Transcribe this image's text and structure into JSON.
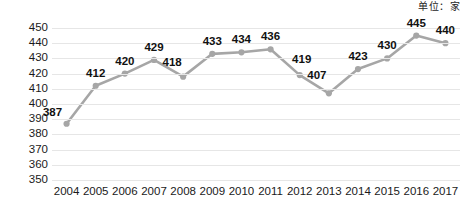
{
  "annotation": {
    "unit_note": "单位：家"
  },
  "chart_data": {
    "type": "line",
    "title": "",
    "subtitle": "",
    "xlabel": "",
    "ylabel": "",
    "unit": "单位：家",
    "categories": [
      "2004",
      "2005",
      "2006",
      "2007",
      "2008",
      "2009",
      "2010",
      "2011",
      "2012",
      "2013",
      "2014",
      "2015",
      "2016",
      "2017"
    ],
    "values": [
      387,
      412,
      420,
      429,
      418,
      433,
      434,
      436,
      419,
      407,
      423,
      430,
      445,
      440
    ],
    "series": [
      {
        "name": "",
        "values": [
          387,
          412,
          420,
          429,
          418,
          433,
          434,
          436,
          419,
          407,
          423,
          430,
          445,
          440
        ]
      }
    ],
    "data_labels": [
      "387",
      "412",
      "420",
      "429",
      "418",
      "433",
      "434",
      "436",
      "419",
      "407",
      "423",
      "430",
      "445",
      "440"
    ],
    "ylim": [
      350,
      450
    ],
    "ytick_step": 10,
    "yticks": [
      "450",
      "440",
      "430",
      "420",
      "410",
      "400",
      "390",
      "380",
      "370",
      "360",
      "350"
    ],
    "xticks": [
      "2004",
      "2005",
      "2006",
      "2007",
      "2008",
      "2009",
      "2010",
      "2011",
      "2012",
      "2013",
      "2014",
      "2015",
      "2016",
      "2017"
    ],
    "grid": true,
    "grid_axis": "y",
    "legend": false,
    "legend_position": "none",
    "marker": "circle",
    "colors": {
      "line": "#a6a6a6",
      "marker": "#a6a6a6",
      "gridline": "#e6e6e6",
      "text": "#1a1a1a",
      "background": "#ffffff"
    }
  }
}
